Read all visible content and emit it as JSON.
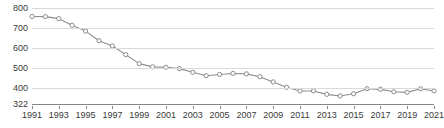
{
  "chart_data": {
    "type": "line",
    "title": "",
    "subtitle": "",
    "xlabel": "",
    "ylabel": "",
    "xlim": [
      1991,
      2021
    ],
    "ylim": [
      322,
      800
    ],
    "grid": true,
    "legend": "none",
    "marker": "open-circle",
    "line_color": "#8c8c8c",
    "marker_fill": "#ffffff",
    "marker_stroke": "#8c8c8c",
    "grid_color": "#d9d9d9",
    "axis_color": "#868686",
    "text_color": "#3a3a3a",
    "y_ticks": [
      800,
      700,
      600,
      500,
      400,
      322
    ],
    "y_tick_labels": [
      "800",
      "700",
      "600",
      "500",
      "400",
      "322"
    ],
    "x_ticks": [
      1991,
      1993,
      1995,
      1997,
      1999,
      2001,
      2003,
      2005,
      2007,
      2009,
      2011,
      2013,
      2015,
      2017,
      2019,
      2021
    ],
    "x_tick_labels": [
      "1991",
      "1993",
      "1995",
      "1997",
      "1999",
      "2001",
      "2003",
      "2005",
      "2007",
      "2009",
      "2011",
      "2013",
      "2015",
      "2017",
      "2019",
      "2021"
    ],
    "x": [
      1991,
      1992,
      1993,
      1994,
      1995,
      1996,
      1997,
      1998,
      1999,
      2000,
      2001,
      2002,
      2003,
      2004,
      2005,
      2006,
      2007,
      2008,
      2009,
      2010,
      2011,
      2012,
      2013,
      2014,
      2015,
      2016,
      2017,
      2018,
      2019,
      2020,
      2021
    ],
    "values": [
      758,
      757,
      747,
      714,
      685,
      637,
      611,
      568,
      523,
      507,
      505,
      498,
      480,
      463,
      469,
      474,
      472,
      458,
      432,
      405,
      387,
      387,
      370,
      362,
      373,
      398,
      395,
      383,
      380,
      398,
      387
    ],
    "series": [
      {
        "name": "value",
        "values": [
          758,
          757,
          747,
          714,
          685,
          637,
          611,
          568,
          523,
          507,
          505,
          498,
          480,
          463,
          469,
          474,
          472,
          458,
          432,
          405,
          387,
          387,
          370,
          362,
          373,
          398,
          395,
          383,
          380,
          398,
          387
        ]
      }
    ]
  }
}
